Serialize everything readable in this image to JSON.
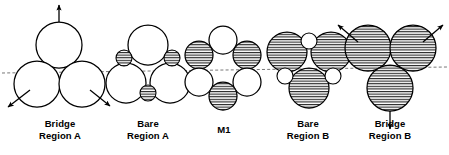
{
  "figure": {
    "type": "packing-diagram",
    "background": "#ffffff",
    "stroke_color": "#000000",
    "hatch_color": "#000000",
    "fill_color": "#ffffff",
    "guide_line": {
      "name": "horizontal-dashed-reference-line",
      "style": "dashed",
      "x1": 2,
      "y1": 73,
      "x2": 447,
      "y2": 67
    }
  },
  "groups": [
    {
      "id": "bridge-region-a",
      "label_line1": "Bridge",
      "label_line2": "Region A",
      "label_x": 16,
      "label_y": 118,
      "label_width": 88,
      "circles": [
        {
          "name": "large-circle-top",
          "cx": 59,
          "cy": 45,
          "r": 23,
          "hatched": false
        },
        {
          "name": "large-circle-lower-left",
          "cx": 37,
          "cy": 84,
          "r": 23,
          "hatched": false
        },
        {
          "name": "large-circle-lower-right",
          "cx": 82,
          "cy": 84,
          "r": 23,
          "hatched": false
        }
      ],
      "arrows": [
        {
          "name": "arrow-up",
          "x1": 59,
          "y1": 22,
          "x2": 59,
          "y2": 5
        },
        {
          "name": "arrow-down-left",
          "x1": 30,
          "y1": 90,
          "x2": 8,
          "y2": 107
        },
        {
          "name": "arrow-down-right",
          "x1": 90,
          "y1": 90,
          "x2": 110,
          "y2": 106
        }
      ]
    },
    {
      "id": "bare-region-a",
      "label_line1": "Bare",
      "label_line2": "Region A",
      "label_x": 104,
      "label_y": 118,
      "label_width": 88,
      "circles": [
        {
          "name": "large-circle-top",
          "cx": 148,
          "cy": 45,
          "r": 20,
          "hatched": false
        },
        {
          "name": "large-circle-lower-left",
          "cx": 126,
          "cy": 83,
          "r": 20,
          "hatched": false
        },
        {
          "name": "large-circle-lower-right",
          "cx": 170,
          "cy": 83,
          "r": 20,
          "hatched": false
        },
        {
          "name": "small-circle-upper-left",
          "cx": 124,
          "cy": 58,
          "r": 8,
          "hatched": true
        },
        {
          "name": "small-circle-upper-right",
          "cx": 172,
          "cy": 58,
          "r": 8,
          "hatched": true
        },
        {
          "name": "small-circle-bottom",
          "cx": 148,
          "cy": 93,
          "r": 8,
          "hatched": true
        }
      ],
      "arrows": []
    },
    {
      "id": "m1",
      "label_line1": "M1",
      "label_line2": "",
      "label_x": 188,
      "label_y": 124,
      "label_width": 72,
      "circles": [
        {
          "name": "circle-top",
          "cx": 223,
          "cy": 40,
          "r": 14,
          "hatched": false
        },
        {
          "name": "circle-upper-left",
          "cx": 199,
          "cy": 55,
          "r": 14,
          "hatched": true
        },
        {
          "name": "circle-upper-right",
          "cx": 247,
          "cy": 55,
          "r": 14,
          "hatched": true
        },
        {
          "name": "circle-lower-left",
          "cx": 199,
          "cy": 82,
          "r": 14,
          "hatched": false
        },
        {
          "name": "circle-lower-right",
          "cx": 247,
          "cy": 82,
          "r": 14,
          "hatched": false
        },
        {
          "name": "circle-bottom",
          "cx": 223,
          "cy": 96,
          "r": 14,
          "hatched": true
        }
      ],
      "arrows": []
    },
    {
      "id": "bare-region-b",
      "label_line1": "Bare",
      "label_line2": "Region B",
      "label_x": 264,
      "label_y": 118,
      "label_width": 88,
      "circles": [
        {
          "name": "large-circle-upper-left",
          "cx": 287,
          "cy": 52,
          "r": 20,
          "hatched": true
        },
        {
          "name": "large-circle-upper-right",
          "cx": 331,
          "cy": 52,
          "r": 20,
          "hatched": true
        },
        {
          "name": "large-circle-bottom",
          "cx": 309,
          "cy": 88,
          "r": 20,
          "hatched": true
        },
        {
          "name": "small-circle-top",
          "cx": 309,
          "cy": 41,
          "r": 8,
          "hatched": false
        },
        {
          "name": "small-circle-lower-left",
          "cx": 285,
          "cy": 76,
          "r": 8,
          "hatched": false
        },
        {
          "name": "small-circle-lower-right",
          "cx": 333,
          "cy": 76,
          "r": 8,
          "hatched": false
        }
      ],
      "arrows": []
    },
    {
      "id": "bridge-region-b",
      "label_line1": "Bridge",
      "label_line2": "Region B",
      "label_x": 346,
      "label_y": 118,
      "label_width": 88,
      "circles": [
        {
          "name": "large-circle-upper-left",
          "cx": 368,
          "cy": 48,
          "r": 23,
          "hatched": true
        },
        {
          "name": "large-circle-upper-right",
          "cx": 413,
          "cy": 48,
          "r": 23,
          "hatched": true
        },
        {
          "name": "large-circle-bottom",
          "cx": 390,
          "cy": 88,
          "r": 23,
          "hatched": true
        }
      ],
      "arrows": [
        {
          "name": "arrow-up-left",
          "x1": 358,
          "y1": 42,
          "x2": 338,
          "y2": 25
        },
        {
          "name": "arrow-up-right",
          "x1": 423,
          "y1": 42,
          "x2": 443,
          "y2": 25
        },
        {
          "name": "arrow-down",
          "x1": 390,
          "y1": 111,
          "x2": 390,
          "y2": 129
        }
      ]
    }
  ]
}
